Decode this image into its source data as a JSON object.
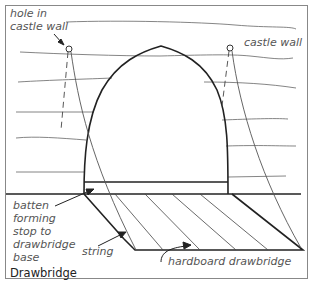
{
  "diagram": {
    "title": "Drawbridge",
    "labels": {
      "hole_in_castle_wall": [
        "hole in",
        "castle wall"
      ],
      "castle_wall": "castle wall",
      "batten": [
        "batten",
        "forming",
        "stop to",
        "drawbridge",
        "base"
      ],
      "string": "string",
      "hardboard_drawbridge": "hardboard drawbridge"
    },
    "colors": {
      "line": "#222222",
      "thin_line": "#666666",
      "label": "#555555",
      "border": "#888888",
      "background": "#ffffff"
    }
  }
}
